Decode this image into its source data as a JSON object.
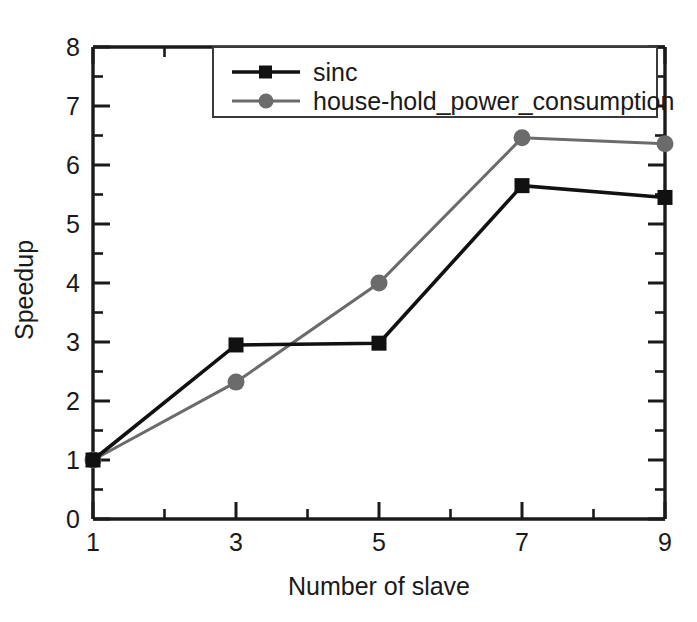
{
  "chart_data": {
    "type": "line",
    "title": "",
    "xlabel": "Number of slave",
    "ylabel": "Speedup",
    "x": [
      1,
      3,
      5,
      7,
      9
    ],
    "xticks": [
      "1",
      "3",
      "5",
      "7",
      "9"
    ],
    "yticks": [
      "0",
      "1",
      "2",
      "3",
      "4",
      "5",
      "6",
      "7",
      "8"
    ],
    "xlim": [
      1,
      9
    ],
    "ylim": [
      0,
      8
    ],
    "grid": false,
    "minor_ticks": true,
    "legend_position": "top-right-inside",
    "series": [
      {
        "name": "sinc",
        "values": [
          1.0,
          2.95,
          2.98,
          5.65,
          5.45
        ],
        "color": "#111111",
        "marker": "square"
      },
      {
        "name": "house-hold_power_consumption",
        "values": [
          1.0,
          2.32,
          4.0,
          6.46,
          6.36
        ],
        "color": "#6b6b6b",
        "marker": "circle"
      }
    ]
  },
  "axes": {
    "x_title": "Number of slave",
    "y_title": "Speedup",
    "x_tick_labels": [
      "1",
      "3",
      "5",
      "7",
      "9"
    ],
    "y_tick_labels": [
      "0",
      "1",
      "2",
      "3",
      "4",
      "5",
      "6",
      "7",
      "8"
    ]
  },
  "legend": {
    "entries": [
      {
        "label": "sinc",
        "marker": "square-marker",
        "color": "#111111"
      },
      {
        "label": "house-hold_power_consumption",
        "marker": "circle-marker",
        "color": "#6b6b6b"
      }
    ]
  },
  "colors": {
    "series_1": "#111111",
    "series_2": "#6b6b6b",
    "axis": "#1a1a1a",
    "background": "#ffffff"
  }
}
